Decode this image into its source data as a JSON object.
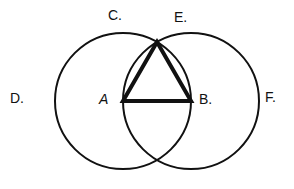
{
  "diagram": {
    "stroke_color": "#111111",
    "background": "#ffffff",
    "points": {
      "A": {
        "label": "A",
        "x": 123,
        "y": 101
      },
      "B": {
        "label": "B.",
        "x": 191,
        "y": 101
      },
      "C": {
        "label": "C.",
        "x": 157,
        "y": 42
      }
    },
    "circles": [
      {
        "center": "A",
        "cx": 123,
        "cy": 101,
        "r": 68
      },
      {
        "center": "B",
        "cx": 191,
        "cy": 101,
        "r": 68
      }
    ],
    "triangle": [
      "A",
      "B",
      "C"
    ],
    "labels": [
      {
        "id": "C",
        "text": "C.",
        "x": 108,
        "y": 8
      },
      {
        "id": "E",
        "text": "E.",
        "x": 174,
        "y": 10
      },
      {
        "id": "D",
        "text": "D.",
        "x": 10,
        "y": 91
      },
      {
        "id": "A",
        "text": "A",
        "x": 99,
        "y": 92
      },
      {
        "id": "B",
        "text": "B.",
        "x": 199,
        "y": 92
      },
      {
        "id": "F",
        "text": "F.",
        "x": 265,
        "y": 90
      }
    ]
  }
}
